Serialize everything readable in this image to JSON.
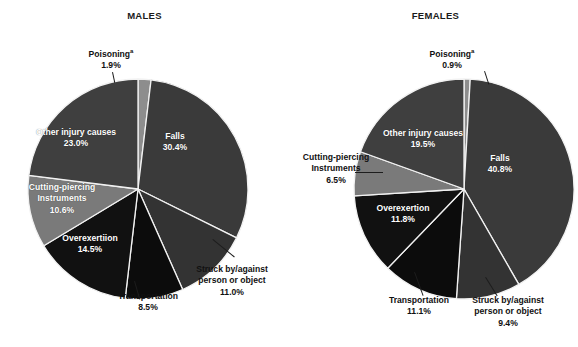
{
  "page": {
    "background": "#ffffff",
    "width": 578,
    "height": 347
  },
  "panels": [
    {
      "id": "males",
      "title": "MALES"
    },
    {
      "id": "females",
      "title": "FEMALES"
    }
  ],
  "labels": {
    "poisoning": "Poisoning",
    "poisoning_sup": "a",
    "falls": "Falls",
    "struck_l1": "Struck by/against",
    "struck_l2": "person or object",
    "transportation": "Transportation",
    "overexertion_males": "Overexertiion",
    "overexertion_females": "Overexertion",
    "cutting_l1": "Cutting-piercing",
    "cutting_l2": "Instruments",
    "other": "Other injury causes"
  },
  "values": {
    "males": {
      "poisoning": "1.9%",
      "falls": "30.4%",
      "struck": "11.0%",
      "transportation": "8.5%",
      "overexertion": "14.5%",
      "cutting": "10.6%",
      "other": "23.0%"
    },
    "females": {
      "poisoning": "0.9%",
      "falls": "40.8%",
      "struck": "9.4%",
      "transportation": "11.1%",
      "overexertion": "11.8%",
      "cutting": "6.5%",
      "other": "19.5%"
    }
  },
  "colors": {
    "poisoning": "#8d8d8d",
    "falls": "#3a3a3a",
    "struck": "#333333",
    "transportation": "#0c0c0c",
    "overexertion": "#111111",
    "cutting": "#7a7a7a",
    "other": "#3f3f3f",
    "separator": "#f2f2f2",
    "text_dark": "#111111",
    "text_light": "#ffffff"
  },
  "chart_data": [
    {
      "type": "pie",
      "title": "MALES",
      "unit": "percent",
      "start_angle_deg": 0,
      "direction": "clockwise",
      "legend": "inline-labels",
      "labels": [
        "Poisoning",
        "Falls",
        "Struck by/against person or object",
        "Transportation",
        "Overexertiion",
        "Cutting-piercing Instruments",
        "Other injury causes"
      ],
      "values": [
        1.9,
        30.4,
        11.0,
        8.5,
        14.5,
        10.6,
        23.0
      ],
      "colors": [
        "#8d8d8d",
        "#3a3a3a",
        "#333333",
        "#0c0c0c",
        "#111111",
        "#7a7a7a",
        "#3f3f3f"
      ]
    },
    {
      "type": "pie",
      "title": "FEMALES",
      "unit": "percent",
      "start_angle_deg": 0,
      "direction": "clockwise",
      "legend": "inline-labels",
      "labels": [
        "Poisoning",
        "Falls",
        "Struck by/against person or object",
        "Transportation",
        "Overexertion",
        "Cutting-piercing Instruments",
        "Other injury causes"
      ],
      "values": [
        0.9,
        40.8,
        9.4,
        11.1,
        11.8,
        6.5,
        19.5
      ],
      "colors": [
        "#8d8d8d",
        "#3a3a3a",
        "#333333",
        "#0c0c0c",
        "#111111",
        "#7a7a7a",
        "#3f3f3f"
      ]
    }
  ]
}
